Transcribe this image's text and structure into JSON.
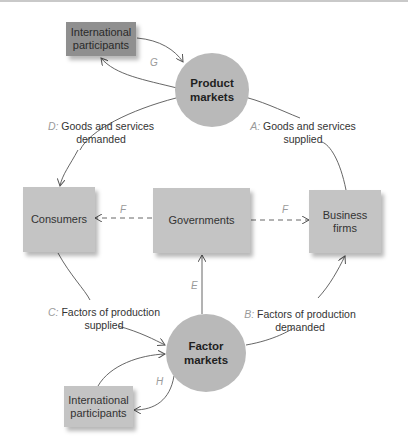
{
  "diagram": {
    "nodes": {
      "intl_top": {
        "label": "International participants",
        "line1": "International",
        "line2": "participants"
      },
      "product_markets": {
        "line1": "Product",
        "line2": "markets"
      },
      "consumers": {
        "label": "Consumers"
      },
      "governments": {
        "label": "Governments"
      },
      "business_firms": {
        "line1": "Business",
        "line2": "firms"
      },
      "factor_markets": {
        "line1": "Factor",
        "line2": "markets"
      },
      "intl_bottom": {
        "line1": "International",
        "line2": "participants"
      }
    },
    "flows": {
      "A": {
        "key": "A:",
        "line1": "Goods and services",
        "line2": "supplied"
      },
      "B": {
        "key": "B:",
        "line1": "Factors of production",
        "line2": "demanded"
      },
      "C": {
        "key": "C:",
        "line1": "Factors of production",
        "line2": "supplied"
      },
      "D": {
        "key": "D:",
        "line1": "Goods and services",
        "line2": "demanded"
      },
      "E": {
        "key": "E"
      },
      "F_left": {
        "key": "F"
      },
      "F_right": {
        "key": "F"
      },
      "G": {
        "key": "G"
      },
      "H": {
        "key": "H"
      }
    },
    "colors": {
      "box": "#c4c4c4",
      "intl_box": "#8f8f8f",
      "circle": "#b9b9b9",
      "arrow": "#555555"
    }
  }
}
